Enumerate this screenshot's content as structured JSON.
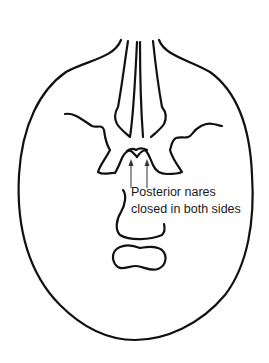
{
  "diagram": {
    "annotation": {
      "line1": "Posterior nares",
      "line2": "closed in both sides"
    },
    "arrows": 2,
    "colors": {
      "line": "#111111",
      "background": "#ffffff"
    }
  }
}
